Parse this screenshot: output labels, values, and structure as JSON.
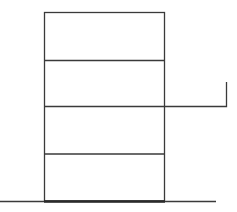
{
  "diagram": {
    "colors": {
      "stroke": "#3a3a3a",
      "background": "#ffffff"
    },
    "building": {
      "x": 44,
      "y": 12,
      "width": 121,
      "height": 189,
      "floors": 4,
      "floor_lines_y": [
        60,
        106,
        154
      ]
    },
    "extension": {
      "from_x": 165,
      "to_x": 226,
      "y": 106,
      "hook_top_y": 82
    },
    "ground": {
      "x1": 0,
      "x2": 216,
      "y": 201
    }
  }
}
